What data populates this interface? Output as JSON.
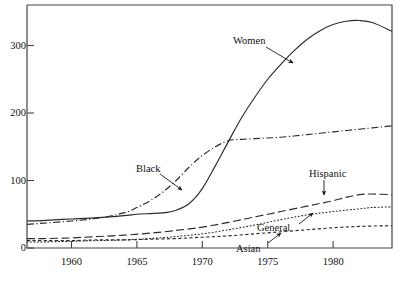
{
  "chart_data": {
    "type": "line",
    "title": "",
    "xlabel": "",
    "ylabel": "",
    "xlim": [
      1956.6,
      1984.5
    ],
    "ylim": [
      0,
      360
    ],
    "xticks": [
      1960,
      1965,
      1970,
      1975,
      1980
    ],
    "xtick_labels": [
      "1960",
      "1965",
      "1970",
      "1975",
      "1980"
    ],
    "yticks": [
      0,
      100,
      200,
      300
    ],
    "ytick_labels": [
      "0",
      "100",
      "200",
      "300"
    ],
    "grid": false,
    "legend": "inline-annotations",
    "series": [
      {
        "name": "Women",
        "label": "Women",
        "style": "solid",
        "x": [
          1956.6,
          1958,
          1960,
          1962,
          1964,
          1965,
          1966,
          1967,
          1968,
          1969,
          1970,
          1971,
          1972,
          1973,
          1974,
          1975,
          1976,
          1977,
          1978,
          1979,
          1980,
          1981,
          1982,
          1983,
          1984.5
        ],
        "y": [
          40,
          41,
          43,
          45,
          48,
          50,
          51,
          52,
          56,
          66,
          88,
          122,
          158,
          193,
          223,
          250,
          272,
          292,
          309,
          322,
          331,
          336,
          337,
          334,
          321
        ]
      },
      {
        "name": "Black",
        "label": "Black",
        "style": "dash-dot",
        "x": [
          1956.6,
          1958,
          1960,
          1962,
          1964,
          1965,
          1966,
          1967,
          1968,
          1969,
          1970,
          1971,
          1972,
          1973,
          1974,
          1975,
          1976,
          1977,
          1978,
          1979,
          1980,
          1981,
          1982,
          1983,
          1984.5
        ],
        "y": [
          35,
          37,
          40,
          44,
          52,
          60,
          70,
          83,
          100,
          120,
          137,
          150,
          159,
          161,
          162,
          163,
          164,
          166,
          168,
          170,
          172,
          174,
          176,
          178,
          181
        ]
      },
      {
        "name": "Hispanic",
        "label": "Hispanic",
        "style": "long-dash",
        "x": [
          1956.6,
          1958,
          1960,
          1962,
          1964,
          1966,
          1968,
          1970,
          1972,
          1974,
          1976,
          1978,
          1979,
          1980,
          1981,
          1982,
          1983,
          1984.5
        ],
        "y": [
          14,
          14,
          15,
          17,
          19,
          22,
          26,
          31,
          38,
          46,
          54,
          62,
          66,
          70,
          75,
          79,
          80,
          79
        ]
      },
      {
        "name": "General",
        "label": "General",
        "style": "dotted",
        "x": [
          1956.6,
          1958,
          1960,
          1962,
          1964,
          1966,
          1968,
          1970,
          1972,
          1974,
          1976,
          1978,
          1980,
          1982,
          1983,
          1984.5
        ],
        "y": [
          9,
          9,
          10,
          11,
          12,
          14,
          17,
          21,
          27,
          34,
          42,
          49,
          54,
          58,
          60,
          61
        ]
      },
      {
        "name": "Asian",
        "label": "Asian",
        "style": "short-dash",
        "x": [
          1956.6,
          1958,
          1960,
          1962,
          1964,
          1966,
          1968,
          1970,
          1972,
          1974,
          1976,
          1978,
          1980,
          1982,
          1984.5
        ],
        "y": [
          11,
          11,
          11,
          12,
          12,
          13,
          14,
          16,
          18,
          21,
          24,
          27,
          30,
          32,
          33
        ]
      }
    ],
    "annotations": [
      {
        "name": "women-label",
        "text": "Women",
        "x_px": 233,
        "y_px": 35,
        "arrow_from": [
          266,
          47
        ],
        "arrow_to": [
          293,
          63
        ]
      },
      {
        "name": "black-label",
        "text": "Black",
        "x_px": 136,
        "y_px": 163,
        "arrow_from": [
          160,
          174
        ],
        "arrow_to": [
          182,
          190
        ]
      },
      {
        "name": "hispanic-label",
        "text": "Hispanic",
        "x_px": 309,
        "y_px": 168,
        "arrow_from": [
          324,
          180
        ],
        "arrow_to": [
          324,
          195
        ]
      },
      {
        "name": "general-label",
        "text": "General",
        "x_px": 257,
        "y_px": 222,
        "arrow_from": [
          299,
          224
        ],
        "arrow_to": [
          313,
          213
        ]
      },
      {
        "name": "asian-label",
        "text": "Asian",
        "x_px": 236,
        "y_px": 243,
        "arrow_from": [
          268,
          243
        ],
        "arrow_to": [
          281,
          233
        ]
      }
    ]
  },
  "axes": {
    "y_labels": [
      "300",
      "200",
      "100",
      "0"
    ],
    "x_labels": [
      "1960",
      "1965",
      "1970",
      "1975",
      "1980"
    ]
  }
}
